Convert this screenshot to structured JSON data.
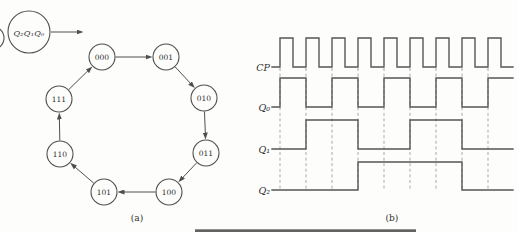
{
  "figure": "3-bit ripple counter: state cycle and timing waveforms",
  "panel_a": {
    "caption": "(a)",
    "bit_order_label": "Q₂Q₁Q₀",
    "legend_circle": {
      "cx": 29,
      "cy": 32,
      "r": 21
    },
    "node_radius": 13,
    "states": [
      {
        "label": "000",
        "cx": 102,
        "cy": 57
      },
      {
        "label": "001",
        "cx": 166,
        "cy": 57
      },
      {
        "label": "010",
        "cx": 204,
        "cy": 98
      },
      {
        "label": "011",
        "cx": 206,
        "cy": 153
      },
      {
        "label": "100",
        "cx": 169,
        "cy": 192
      },
      {
        "label": "101",
        "cx": 104,
        "cy": 192
      },
      {
        "label": "110",
        "cx": 60,
        "cy": 154
      },
      {
        "label": "111",
        "cx": 59,
        "cy": 99
      }
    ],
    "cycle_order": [
      "000",
      "001",
      "010",
      "011",
      "100",
      "101",
      "110",
      "111",
      "000"
    ]
  },
  "panel_b": {
    "caption": "(b)",
    "x_label_right": 270,
    "x_start": 272,
    "x_end": 513,
    "clock_edges_x": [
      280,
      306,
      332,
      358,
      384,
      410,
      436,
      462,
      488
    ],
    "pulse_high_width": 13,
    "signals": [
      {
        "label": "CP",
        "kind": "clock",
        "high_y": 38,
        "low_y": 67
      },
      {
        "label": "Q₀",
        "kind": "wave",
        "high_y": 78,
        "low_y": 107,
        "levels": [
          0,
          1,
          0,
          1,
          0,
          1,
          0,
          1,
          0,
          1
        ]
      },
      {
        "label": "Q₁",
        "kind": "wave",
        "high_y": 120,
        "low_y": 149,
        "levels": [
          0,
          0,
          1,
          1,
          0,
          0,
          1,
          1,
          0,
          0
        ]
      },
      {
        "label": "Q₂",
        "kind": "wave",
        "high_y": 162,
        "low_y": 190,
        "levels": [
          0,
          0,
          0,
          0,
          1,
          1,
          1,
          1,
          0,
          0
        ]
      }
    ]
  },
  "colors": {
    "line": "#4f4f4f",
    "dash": "#ada7a4",
    "text": "#2e2e2e",
    "background": "#fdfdfc"
  }
}
